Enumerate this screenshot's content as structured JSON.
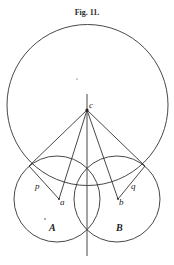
{
  "figure": {
    "title": "Fig. 11.",
    "stroke_color": "#333333",
    "background": "#ffffff"
  },
  "diagram": {
    "big_circle": {
      "cx": 87.5,
      "cy": 105,
      "r": 80.5
    },
    "circle_A": {
      "cx": 57,
      "cy": 199,
      "r": 43,
      "label": "A"
    },
    "circle_B": {
      "cx": 117,
      "cy": 199,
      "r": 43,
      "label": "B"
    },
    "vertical_axis": {
      "x": 87,
      "y1": 94,
      "y2": 256
    },
    "points": {
      "c": {
        "x": 87,
        "y": 110,
        "label": "c"
      },
      "a": {
        "x": 59,
        "y": 199,
        "label": "a"
      },
      "b": {
        "x": 118,
        "y": 199,
        "label": "b"
      },
      "p": {
        "x": 29,
        "y": 166,
        "label": "p"
      },
      "q": {
        "x": 145,
        "y": 166,
        "label": "q"
      }
    },
    "labels": {
      "c": "c",
      "a": "a",
      "b": "b",
      "p": "p",
      "q": "q",
      "A": "A",
      "B": "B"
    }
  }
}
